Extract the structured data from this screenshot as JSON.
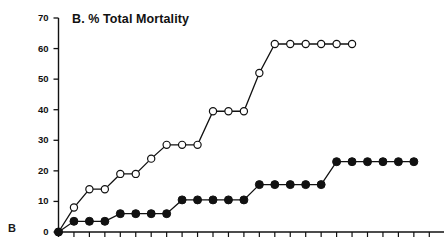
{
  "figure": {
    "panel_letter": "B",
    "title": "B.  % Total Mortality",
    "background_color": "#ffffff",
    "ink_color": "#111111"
  },
  "axes": {
    "y_tick_labels": [
      "70",
      "60",
      "50",
      "40",
      "30",
      "20",
      "10",
      "0"
    ],
    "x_tick_labels": []
  },
  "chart_data": {
    "type": "line",
    "title": "B.  % Total Mortality",
    "xlabel": "",
    "ylabel": "",
    "ylim": [
      0,
      70
    ],
    "xlim": [
      0,
      25
    ],
    "y_ticks": [
      0,
      10,
      20,
      30,
      40,
      50,
      60,
      70
    ],
    "x_tick_count": 25,
    "x_tick_labels_visible": false,
    "grid": false,
    "legend": null,
    "series": [
      {
        "name": "open-circles",
        "marker": "open-circle",
        "marker_fill": "#ffffff",
        "marker_edge_color": "#111111",
        "line_color": "#111111",
        "x": [
          0,
          1,
          2,
          3,
          4,
          5,
          6,
          7,
          8,
          9,
          10,
          11,
          12,
          13,
          14,
          15,
          16,
          17,
          18,
          19
        ],
        "values": [
          0,
          8,
          14,
          14,
          19,
          19,
          24,
          28.5,
          28.5,
          28.5,
          39.5,
          39.5,
          39.5,
          52,
          61.5,
          61.5,
          61.5,
          61.5,
          61.5,
          61.5
        ]
      },
      {
        "name": "filled-circles",
        "marker": "filled-circle",
        "marker_fill": "#111111",
        "marker_edge_color": "#111111",
        "line_color": "#111111",
        "x": [
          0,
          1,
          2,
          3,
          4,
          5,
          6,
          7,
          8,
          9,
          10,
          11,
          12,
          13,
          14,
          15,
          16,
          17,
          18,
          19,
          20,
          21,
          22,
          23
        ],
        "values": [
          0,
          3.5,
          3.5,
          3.5,
          6,
          6,
          6,
          6,
          10.5,
          10.5,
          10.5,
          10.5,
          10.5,
          15.5,
          15.5,
          15.5,
          15.5,
          15.5,
          23,
          23,
          23,
          23,
          23,
          23
        ]
      }
    ]
  }
}
